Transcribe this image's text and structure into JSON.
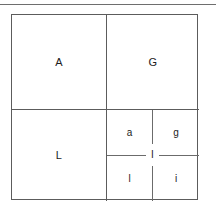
{
  "diagram": {
    "top_rule_visible": true,
    "border_color": "#5c5c5c",
    "background_color": "#ffffff",
    "text_color": "#1c1c1c",
    "quadrants": [
      {
        "position": "top-left",
        "label": "A"
      },
      {
        "position": "top-right",
        "label": "G"
      },
      {
        "position": "bottom-left",
        "label": "L"
      }
    ],
    "subgrid": {
      "position": "bottom-right",
      "cells": [
        {
          "position": "top-left",
          "label": "a"
        },
        {
          "position": "top-right",
          "label": "g"
        },
        {
          "position": "bottom-left",
          "label": "l"
        },
        {
          "position": "bottom-right",
          "label": "i"
        }
      ],
      "center_label": "I"
    }
  }
}
